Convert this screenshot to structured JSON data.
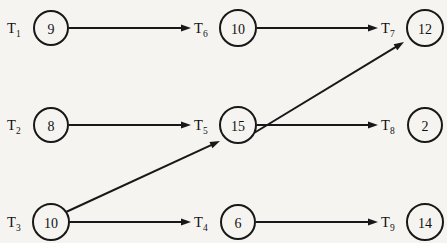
{
  "diagram": {
    "background_color": "#f6f4f1",
    "stroke_color": "#181818",
    "text_color": "#111111",
    "nodes": [
      {
        "id": "T1",
        "label_main": "T",
        "label_sub": "1",
        "value": "9",
        "cx": 51,
        "cy": 28,
        "r": 17,
        "label_x": 7,
        "label_y": 33
      },
      {
        "id": "T6",
        "label_main": "T",
        "label_sub": "6",
        "value": "10",
        "cx": 238,
        "cy": 28,
        "r": 18,
        "label_x": 194,
        "label_y": 33
      },
      {
        "id": "T7",
        "label_main": "T",
        "label_sub": "7",
        "value": "12",
        "cx": 425,
        "cy": 28,
        "r": 18,
        "label_x": 381,
        "label_y": 33
      },
      {
        "id": "T2",
        "label_main": "T",
        "label_sub": "2",
        "value": "8",
        "cx": 51,
        "cy": 125,
        "r": 17,
        "label_x": 7,
        "label_y": 130
      },
      {
        "id": "T5",
        "label_main": "T",
        "label_sub": "5",
        "value": "15",
        "cx": 238,
        "cy": 125,
        "r": 18,
        "label_x": 194,
        "label_y": 130
      },
      {
        "id": "T8",
        "label_main": "T",
        "label_sub": "8",
        "value": "2",
        "cx": 425,
        "cy": 125,
        "r": 17,
        "label_x": 381,
        "label_y": 130
      },
      {
        "id": "T3",
        "label_main": "T",
        "label_sub": "3",
        "value": "10",
        "cx": 51,
        "cy": 222,
        "r": 18,
        "label_x": 7,
        "label_y": 227
      },
      {
        "id": "T4",
        "label_main": "T",
        "label_sub": "4",
        "value": "6",
        "cx": 238,
        "cy": 222,
        "r": 17,
        "label_x": 194,
        "label_y": 227
      },
      {
        "id": "T9",
        "label_main": "T",
        "label_sub": "9",
        "value": "14",
        "cx": 425,
        "cy": 222,
        "r": 18,
        "label_x": 381,
        "label_y": 227
      }
    ],
    "edges": [
      {
        "id": "T1-T6",
        "from": "T1",
        "to": "T6",
        "x1": 69,
        "y1": 28,
        "x2": 191,
        "y2": 28
      },
      {
        "id": "T6-T7",
        "from": "T6",
        "to": "T7",
        "x1": 257,
        "y1": 28,
        "x2": 378,
        "y2": 28
      },
      {
        "id": "T2-T5",
        "from": "T2",
        "to": "T5",
        "x1": 69,
        "y1": 125,
        "x2": 191,
        "y2": 125
      },
      {
        "id": "T5-T8",
        "from": "T5",
        "to": "T8",
        "x1": 257,
        "y1": 125,
        "x2": 378,
        "y2": 125
      },
      {
        "id": "T3-T4",
        "from": "T3",
        "to": "T4",
        "x1": 69,
        "y1": 222,
        "x2": 191,
        "y2": 222
      },
      {
        "id": "T4-T9",
        "from": "T4",
        "to": "T9",
        "x1": 256,
        "y1": 222,
        "x2": 378,
        "y2": 222
      },
      {
        "id": "T3-T5",
        "from": "T3",
        "to": "T5",
        "x1": 66,
        "y1": 212,
        "x2": 220,
        "y2": 141
      },
      {
        "id": "T5-T7",
        "from": "T5",
        "to": "T7",
        "x1": 254,
        "y1": 133,
        "x2": 404,
        "y2": 42
      }
    ]
  }
}
